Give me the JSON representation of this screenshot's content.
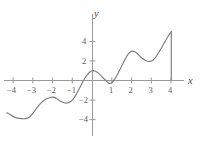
{
  "figure": {
    "background": "#fefefe",
    "width": 208,
    "height": 143,
    "axis_color": "#9a9a9a",
    "curve_color": "#7d7d7d",
    "label_color": "#5c5c5c"
  },
  "axes": {
    "x_label": "x",
    "y_label": "y",
    "x_ticks": [
      {
        "value": -4,
        "label": "−4"
      },
      {
        "value": -3,
        "label": "−3"
      },
      {
        "value": -2,
        "label": "−2"
      },
      {
        "value": -1,
        "label": "−1"
      },
      {
        "value": 1,
        "label": "1"
      },
      {
        "value": 2,
        "label": "2"
      },
      {
        "value": 3,
        "label": "3"
      },
      {
        "value": 4,
        "label": "4"
      }
    ],
    "y_ticks": [
      {
        "value": 4,
        "label": "4"
      },
      {
        "value": 2,
        "label": "2"
      },
      {
        "value": -2,
        "label": "−2"
      },
      {
        "value": -4,
        "label": "−4"
      }
    ]
  },
  "chart_data": {
    "type": "line",
    "title": "",
    "xlabel": "x",
    "ylabel": "y",
    "xlim": [
      -4.35,
      4.0
    ],
    "ylim": [
      -4.4,
      5.2
    ],
    "grid": false,
    "legend": null,
    "series": [
      {
        "name": "f",
        "color": "#7d7d7d",
        "x": [
          -4.35,
          -4.2,
          -4.0,
          -3.8,
          -3.6,
          -3.4,
          -3.25,
          -3.1,
          -2.9,
          -2.7,
          -2.5,
          -2.3,
          -2.1,
          -2.0,
          -1.9,
          -1.75,
          -1.6,
          -1.45,
          -1.3,
          -1.15,
          -1.0,
          -0.85,
          -0.7,
          -0.55,
          -0.4,
          -0.28,
          -0.15,
          0.0,
          0.15,
          0.3,
          0.45,
          0.6,
          0.75,
          0.85,
          1.0,
          1.15,
          1.3,
          1.5,
          1.7,
          1.85,
          2.0,
          2.15,
          2.3,
          2.5,
          2.7,
          2.9,
          3.05,
          3.2,
          3.4,
          3.6,
          3.8,
          4.0
        ],
        "y": [
          -3.3,
          -3.45,
          -3.7,
          -3.85,
          -3.9,
          -3.9,
          -3.8,
          -3.55,
          -3.0,
          -2.5,
          -2.1,
          -1.85,
          -1.72,
          -1.7,
          -1.75,
          -1.95,
          -2.15,
          -2.28,
          -2.3,
          -2.2,
          -1.95,
          -1.5,
          -0.95,
          -0.35,
          0.2,
          0.55,
          0.85,
          1.0,
          0.95,
          0.75,
          0.45,
          0.15,
          -0.15,
          -0.3,
          -0.2,
          0.2,
          0.75,
          1.55,
          2.35,
          2.8,
          3.0,
          2.95,
          2.7,
          2.3,
          2.05,
          1.95,
          2.05,
          2.35,
          3.0,
          3.7,
          4.4,
          5.0
        ]
      }
    ],
    "annotations": [
      {
        "type": "vertical-segment",
        "x": 4.0,
        "y_from": 0.0,
        "y_to": 5.0,
        "note": "closing vertical line at right endpoint"
      }
    ],
    "key_points": {
      "local_minima": [
        {
          "x": -3.3,
          "y": -3.9
        },
        {
          "x": -1.3,
          "y": -2.3
        },
        {
          "x": 0.85,
          "y": -0.3
        },
        {
          "x": 2.9,
          "y": 1.95
        }
      ],
      "local_maxima": [
        {
          "x": -2.0,
          "y": -1.7
        },
        {
          "x": 0.0,
          "y": 1.0
        },
        {
          "x": 2.0,
          "y": 3.0
        }
      ],
      "endpoints": [
        {
          "x": -4.35,
          "y": -3.3
        },
        {
          "x": 4.0,
          "y": 5.0
        }
      ],
      "x_intercepts": [
        -0.42,
        0.63,
        1.08
      ]
    }
  }
}
